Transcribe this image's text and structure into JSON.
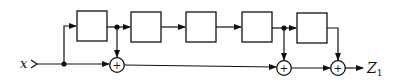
{
  "diagram": {
    "input_label": "x",
    "output_label": "Z",
    "output_subscript": "1",
    "adder_symbol": "+",
    "stroke_color": "#111111",
    "background": "#ffffff",
    "delay_blocks": [
      {
        "id": "block-1",
        "label": ""
      },
      {
        "id": "block-2",
        "label": ""
      },
      {
        "id": "block-3",
        "label": ""
      },
      {
        "id": "block-4",
        "label": ""
      },
      {
        "id": "block-5",
        "label": ""
      }
    ],
    "adders": [
      {
        "id": "adder-1",
        "symbol": "+"
      },
      {
        "id": "adder-2",
        "symbol": "+"
      },
      {
        "id": "adder-3",
        "symbol": "+"
      }
    ]
  }
}
